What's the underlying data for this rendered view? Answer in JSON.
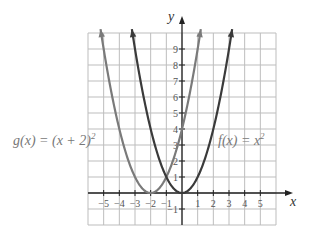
{
  "chart_data": {
    "type": "line",
    "title": "",
    "xlabel": "x",
    "ylabel": "y",
    "xlim": [
      -6,
      6
    ],
    "ylim": [
      -2,
      10
    ],
    "grid": true,
    "x_ticks": [
      -5,
      -4,
      -3,
      -2,
      -1,
      1,
      2,
      3,
      4,
      5
    ],
    "x_tick_labels": [
      "−5",
      "−4",
      "−3",
      "−2",
      "−1",
      "1",
      "2",
      "3",
      "4",
      "5"
    ],
    "y_ticks": [
      -1,
      1,
      2,
      3,
      4,
      5,
      6,
      7,
      8,
      9
    ],
    "y_tick_labels": [
      "−1",
      "1",
      "2",
      "3",
      "4",
      "5",
      "6",
      "7",
      "8",
      "9"
    ],
    "series": [
      {
        "name": "g(x) = (x + 2)²",
        "label_parts": {
          "main": "g(x) = (x + 2)",
          "sup": "2"
        },
        "shift": -2,
        "domain": [
          -5.2,
          1.2
        ],
        "color": "#7a7a7a",
        "label_position": "left"
      },
      {
        "name": "f(x) = x²",
        "label_parts": {
          "main": "f(x) = x",
          "sup": "2"
        },
        "shift": 0,
        "domain": [
          -3.2,
          3.2
        ],
        "color": "#3a3a3a",
        "label_position": "right"
      }
    ],
    "axis_color": "#222222",
    "grid_color": "#bdbdbd"
  }
}
